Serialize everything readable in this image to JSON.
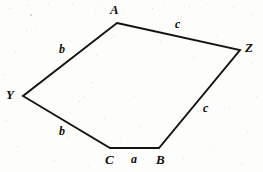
{
  "figure": {
    "kind": "geometry-diagram",
    "shape": "pentagon",
    "background_color": "#fdfdfb",
    "ink_color": "#17140f",
    "vertices": [
      {
        "id": "A",
        "label": "A",
        "x": 117,
        "y": 23,
        "label_x": 110,
        "label_y": 3
      },
      {
        "id": "Z",
        "label": "Z",
        "x": 240,
        "y": 50,
        "label_x": 245,
        "label_y": 41
      },
      {
        "id": "B",
        "label": "B",
        "x": 159,
        "y": 148,
        "label_x": 156,
        "label_y": 153
      },
      {
        "id": "C",
        "label": "C",
        "x": 110,
        "y": 148,
        "label_x": 105,
        "label_y": 153
      },
      {
        "id": "Y",
        "label": "Y",
        "x": 23,
        "y": 96,
        "label_x": 6,
        "label_y": 88
      }
    ],
    "edges": [
      {
        "id": "edge-A-Z",
        "from": "A",
        "to": "Z",
        "label": "c",
        "label_x": 175,
        "label_y": 18
      },
      {
        "id": "edge-Z-B",
        "from": "Z",
        "to": "B",
        "label": "c",
        "label_x": 203,
        "label_y": 102
      },
      {
        "id": "edge-B-C",
        "from": "B",
        "to": "C",
        "label": "a",
        "label_x": 131,
        "label_y": 153
      },
      {
        "id": "edge-C-Y",
        "from": "C",
        "to": "Y",
        "label": "b",
        "label_x": 59,
        "label_y": 125
      },
      {
        "id": "edge-Y-A",
        "from": "Y",
        "to": "A",
        "label": "b",
        "label_x": 59,
        "label_y": 43
      }
    ],
    "path": "M 117 23 L 240 50 L 159 148 L 110 148 L 23 96 Z",
    "specks": [
      {
        "x": 9,
        "y": 8,
        "s": 1.3
      },
      {
        "x": 28,
        "y": 5,
        "s": 1.0
      },
      {
        "x": 30,
        "y": 14,
        "s": 1.6
      },
      {
        "x": 48,
        "y": 3,
        "s": 1.0
      },
      {
        "x": 26,
        "y": 30,
        "s": 1.2
      },
      {
        "x": 36,
        "y": 27,
        "s": 0.9
      },
      {
        "x": 72,
        "y": 4,
        "s": 1.1
      },
      {
        "x": 95,
        "y": 10,
        "s": 0.9
      },
      {
        "x": 101,
        "y": 3,
        "s": 1.0
      },
      {
        "x": 113,
        "y": 35,
        "s": 1.1
      },
      {
        "x": 152,
        "y": 8,
        "s": 1.2
      },
      {
        "x": 163,
        "y": 2,
        "s": 0.9
      },
      {
        "x": 189,
        "y": 6,
        "s": 1.1
      },
      {
        "x": 206,
        "y": 4,
        "s": 0.9
      },
      {
        "x": 233,
        "y": 7,
        "s": 1.0
      },
      {
        "x": 251,
        "y": 14,
        "s": 1.2
      },
      {
        "x": 15,
        "y": 52,
        "s": 1.1
      },
      {
        "x": 63,
        "y": 70,
        "s": 1.0
      },
      {
        "x": 91,
        "y": 82,
        "s": 1.3
      },
      {
        "x": 96,
        "y": 55,
        "s": 0.9
      },
      {
        "x": 125,
        "y": 44,
        "s": 0.9
      },
      {
        "x": 160,
        "y": 41,
        "s": 1.0
      },
      {
        "x": 193,
        "y": 57,
        "s": 1.1
      },
      {
        "x": 216,
        "y": 36,
        "s": 0.9
      },
      {
        "x": 252,
        "y": 63,
        "s": 1.0
      },
      {
        "x": 6,
        "y": 120,
        "s": 1.1
      },
      {
        "x": 40,
        "y": 108,
        "s": 0.9
      },
      {
        "x": 79,
        "y": 101,
        "s": 1.4
      },
      {
        "x": 84,
        "y": 96,
        "s": 1.0
      },
      {
        "x": 104,
        "y": 118,
        "s": 1.0
      },
      {
        "x": 140,
        "y": 126,
        "s": 1.1
      },
      {
        "x": 134,
        "y": 96,
        "s": 0.9
      },
      {
        "x": 178,
        "y": 120,
        "s": 1.0
      },
      {
        "x": 229,
        "y": 108,
        "s": 1.2
      },
      {
        "x": 247,
        "y": 132,
        "s": 1.0
      },
      {
        "x": 17,
        "y": 146,
        "s": 1.0
      },
      {
        "x": 54,
        "y": 160,
        "s": 1.1
      },
      {
        "x": 88,
        "y": 166,
        "s": 0.9
      },
      {
        "x": 120,
        "y": 141,
        "s": 0.9
      },
      {
        "x": 183,
        "y": 158,
        "s": 1.2
      },
      {
        "x": 210,
        "y": 147,
        "s": 1.0
      },
      {
        "x": 241,
        "y": 164,
        "s": 1.1
      },
      {
        "x": 256,
        "y": 96,
        "s": 0.9
      },
      {
        "x": 3,
        "y": 74,
        "s": 1.0
      },
      {
        "x": 68,
        "y": 136,
        "s": 0.8
      },
      {
        "x": 149,
        "y": 62,
        "s": 0.8
      }
    ]
  }
}
